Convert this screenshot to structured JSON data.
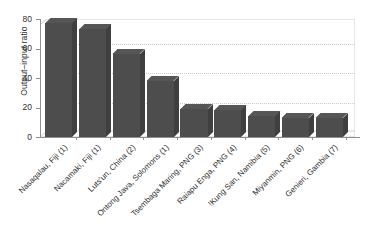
{
  "chart_data": {
    "type": "bar",
    "title": "",
    "subtitle": "",
    "xlabel": "",
    "ylabel": "Output–input ratio",
    "ylim": [
      0,
      80
    ],
    "yticks": [
      0,
      20,
      40,
      60,
      80
    ],
    "ytick_labels": [
      "0",
      "20",
      "40",
      "60",
      "80"
    ],
    "grid": true,
    "grid_axis": "y",
    "legend": false,
    "legend_position": "none",
    "style": "3d-bar",
    "bar_color": "#4d4d4d",
    "bar_top_color": "#565656",
    "bar_side_color": "#3f3f3f",
    "grid_color": "#c9c9c9",
    "axis_color": "#8f8f8f",
    "background": "#ffffff",
    "categories": [
      "Nasaqalau, Fiji (1)",
      "Nacamaki, Fiji (1)",
      "Luts'un, China (2)",
      "Ontong Java, Solomons (1)",
      "Tsembaga Maring, PNG (3)",
      "Raiapu Enga, PNG (4)",
      "!Kung San, Namibia (5)",
      "Miyanmin, PNG (6)",
      "Genieri, Gambia (7)"
    ],
    "values": [
      77,
      73,
      56,
      38,
      19,
      18,
      14,
      13,
      13
    ]
  }
}
